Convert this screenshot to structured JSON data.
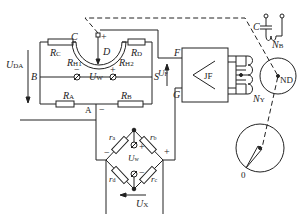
{
  "diagram": {
    "type": "circuit",
    "components": {
      "resistors": [
        "R_C",
        "R_D",
        "R_A",
        "R_B",
        "r_a",
        "r_b",
        "r_c",
        "r_d"
      ],
      "slidewire": [
        "R_H1",
        "R_H2"
      ],
      "amplifier": "JF",
      "motor_winding": "N_Y",
      "excitation_winding": "N_B",
      "capacitor": "C",
      "motor": "ND",
      "pointer_dial_zero": "0"
    },
    "labels": {
      "RC": "R",
      "RC_sub": "C",
      "RD": "R",
      "RD_sub": "D",
      "RA": "R",
      "RA_sub": "A",
      "RB": "R",
      "RB_sub": "B",
      "RH1": "R",
      "RH1_sub": "H1",
      "RH2": "R",
      "RH2_sub": "H2",
      "node_C": "C",
      "node_D": "D",
      "node_B": "B",
      "node_S": "S",
      "node_A": "A",
      "node_F": "F",
      "node_G": "G",
      "plus": "+",
      "minus": "−",
      "UDA": "U",
      "UDA_sub": "DA",
      "UW": "U",
      "UW_sub": "W",
      "UF": "U",
      "UF_sub": "F",
      "UX": "U",
      "UX_sub": "X",
      "Uw": "U",
      "Uw_sub": "w",
      "ra": "r",
      "ra_sub": "a",
      "rb": "r",
      "rb_sub": "b",
      "rc": "r",
      "rc_sub": "c",
      "rd": "r",
      "rd_sub": "d",
      "JF": "JF",
      "NY": "N",
      "NY_sub": "Y",
      "NB": "N",
      "NB_sub": "B",
      "cap_C": "C",
      "ND": "ND",
      "zero": "0"
    }
  }
}
